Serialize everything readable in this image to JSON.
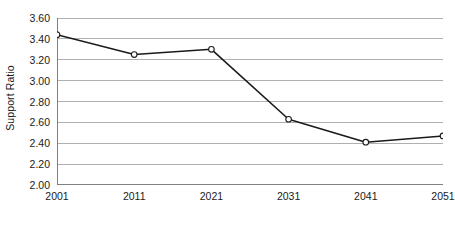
{
  "chart_data": {
    "type": "line",
    "title": "",
    "subtitle": "",
    "xlabel": "",
    "ylabel": "Support Ratio",
    "x": [
      2001,
      2011,
      2021,
      2031,
      2041,
      2051
    ],
    "categories": [
      "2001",
      "2011",
      "2021",
      "2031",
      "2041",
      "2051"
    ],
    "values": [
      3.44,
      3.25,
      3.3,
      2.63,
      2.41,
      2.47
    ],
    "series": [
      {
        "name": "Support Ratio",
        "values": [
          3.44,
          3.25,
          3.3,
          2.63,
          2.41,
          2.47
        ]
      }
    ],
    "ylim": [
      2.0,
      3.6
    ],
    "ytick_step": 0.2,
    "ytick_labels": [
      "2.00",
      "2.20",
      "2.40",
      "2.60",
      "2.80",
      "3.00",
      "3.20",
      "3.40",
      "3.60"
    ],
    "ytick_values": [
      2.0,
      2.2,
      2.4,
      2.6,
      2.8,
      3.0,
      3.2,
      3.4,
      3.6
    ],
    "xtick_labels": [
      "2001",
      "2011",
      "2021",
      "2031",
      "2041",
      "2051"
    ],
    "grid": true,
    "grid_axis": "y",
    "legend": false,
    "legend_position": "none",
    "marker": "open-circle",
    "colors": {
      "line": "#1a1a1a",
      "marker_fill": "#ffffff",
      "marker_stroke": "#1a1a1a",
      "grid": "#b0b0b0",
      "axis": "#808080",
      "text": "#1a1a1a",
      "background": "#ffffff"
    }
  }
}
